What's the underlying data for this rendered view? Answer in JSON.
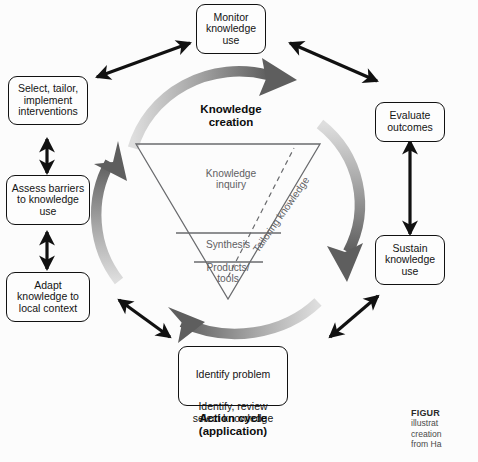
{
  "figure": {
    "kind": "knowledge-to-action-cycle-diagram",
    "background_color": "#fcfcfc",
    "arrow_color": "#111111",
    "arc_color_dark": "#5a5a5a",
    "arc_color_light": "#d8d8d8",
    "triangle_text_color": "#5f6063"
  },
  "center": {
    "knowledge_creation_label": "Knowledge\ncreation",
    "action_cycle_label": "Action cycle\n(application)",
    "triangle": {
      "sections": [
        {
          "id": "inquiry",
          "label": "Knowledge\ninquiry"
        },
        {
          "id": "synthesis",
          "label": "Synthesis"
        },
        {
          "id": "products",
          "label": "Products/\ntools"
        }
      ],
      "diagonal_label": "Tailoring knowledge"
    }
  },
  "nodes": [
    {
      "id": "monitor-knowledge-use",
      "label": "Monitor\nknowledge\nuse"
    },
    {
      "id": "evaluate-outcomes",
      "label": "Evaluate\noutcomes"
    },
    {
      "id": "sustain-knowledge-use",
      "label": "Sustain\nknowledge\nuse"
    },
    {
      "id": "select-tailor-implement-interventions",
      "label": "Select, tailor,\nimplement\ninterventions"
    },
    {
      "id": "assess-barriers-to-knowledge-use",
      "label": "Assess barriers\nto knowledge\nuse"
    },
    {
      "id": "adapt-knowledge-to-local-context",
      "label": "Adapt\nknowledge to\nlocal context"
    }
  ],
  "identify_box": {
    "top_label": "Identify problem",
    "bottom_label": "Identify, review\nselect knowledge"
  },
  "caption": {
    "lines": [
      {
        "id": "line-1",
        "bold_prefix": "FIGUR",
        "text": ""
      },
      {
        "id": "line-2",
        "bold_prefix": "",
        "text": "illustrat"
      },
      {
        "id": "line-3",
        "bold_prefix": "",
        "text": "creation"
      },
      {
        "id": "line-4",
        "bold_prefix": "",
        "text": "from Ha"
      }
    ]
  }
}
